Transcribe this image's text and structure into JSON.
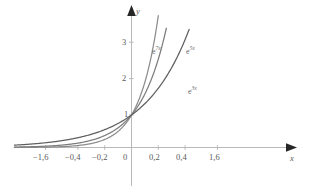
{
  "chart_data": {
    "type": "line",
    "title": "",
    "subtitle": "",
    "xlabel": "x",
    "ylabel": "y",
    "xlim": [
      -1.95,
      1.95
    ],
    "ylim": [
      -0.22,
      3.62
    ],
    "grid": false,
    "legend": "inline-curve-labels",
    "decimal_separator": ",",
    "xticks": [
      {
        "value": -1.6,
        "label": "−1,6"
      },
      {
        "value": -0.4,
        "label": "−0,4"
      },
      {
        "value": -0.2,
        "label": "−0,2"
      },
      {
        "value": 0.0,
        "label": "0"
      },
      {
        "value": 0.2,
        "label": "0,2"
      },
      {
        "value": 0.4,
        "label": "0,4"
      },
      {
        "value": 1.6,
        "label": "1,6"
      }
    ],
    "yticks": [
      {
        "value": 1,
        "label": "1"
      },
      {
        "value": 2,
        "label": "2"
      },
      {
        "value": 3,
        "label": "3"
      }
    ],
    "series": [
      {
        "name": "e^{7x}",
        "label_base": "e",
        "label_exponent": "7x",
        "formula": "y = e^(7x)",
        "rate": 7,
        "color": "#8c8c8c",
        "x": [
          -1.95,
          -1.6,
          -1.2,
          -0.8,
          -0.6,
          -0.4,
          -0.3,
          -0.2,
          -0.15,
          -0.1,
          -0.05,
          0,
          0.05,
          0.1,
          0.15,
          0.18,
          0.2
        ],
        "y": [
          0.0,
          0.0,
          0.0,
          0.004,
          0.015,
          0.061,
          0.122,
          0.247,
          0.35,
          0.497,
          0.705,
          1.0,
          1.419,
          2.014,
          2.858,
          3.525,
          4.055
        ]
      },
      {
        "name": "e^{5x}",
        "label_base": "e",
        "label_exponent": "5x",
        "formula": "y = e^(5x)",
        "rate": 5,
        "color": "#7d7d7d",
        "x": [
          -1.95,
          -1.6,
          -1.2,
          -0.8,
          -0.6,
          -0.4,
          -0.3,
          -0.2,
          -0.1,
          0,
          0.05,
          0.1,
          0.15,
          0.2,
          0.25,
          0.26
        ],
        "y": [
          0.0,
          0.0,
          0.002,
          0.018,
          0.05,
          0.135,
          0.223,
          0.368,
          0.607,
          1.0,
          1.284,
          1.649,
          2.117,
          2.718,
          3.49,
          3.669
        ]
      },
      {
        "name": "e^{3x}",
        "label_base": "e",
        "label_exponent": "3x",
        "formula": "y = e^(3x)",
        "rate": 3,
        "color": "#606060",
        "x": [
          -1.95,
          -1.6,
          -1.2,
          -0.8,
          -0.6,
          -0.4,
          -0.2,
          0,
          0.1,
          0.2,
          0.3,
          0.35,
          0.4,
          0.43
        ],
        "y": [
          0.003,
          0.008,
          0.027,
          0.091,
          0.165,
          0.301,
          0.549,
          1.0,
          1.35,
          1.822,
          2.46,
          2.858,
          3.32,
          3.635
        ]
      }
    ],
    "curve_labels": [
      {
        "text_base": "e",
        "text_exponent": "7x",
        "x_px": 152,
        "y_px": 47
      },
      {
        "text_base": "e",
        "text_exponent": "5x",
        "x_px": 186,
        "y_px": 47
      },
      {
        "text_base": "e",
        "text_exponent": "3x",
        "x_px": 188,
        "y_px": 87
      }
    ],
    "axis_arrows": {
      "x": "right",
      "y": "up"
    },
    "axis_color": "#b4b4b4"
  }
}
